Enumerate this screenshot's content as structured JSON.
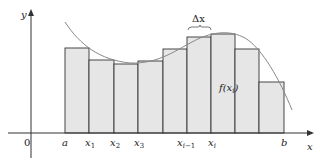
{
  "diagram": {
    "axes": {
      "x_label": "x",
      "y_label": "y",
      "origin_label": "0"
    },
    "tick_labels": [
      "a",
      "x1",
      "x2",
      "x3",
      "xi-1",
      "xi",
      "b"
    ],
    "annotations": {
      "delta": "Δx",
      "height": "f(xi)"
    },
    "rect_fill": "#e6e6e6",
    "stroke": "#333333",
    "curve_color": "#888888",
    "rects": [
      {
        "x": 65,
        "top": 48
      },
      {
        "x": 89,
        "top": 60
      },
      {
        "x": 114,
        "top": 64
      },
      {
        "x": 138,
        "top": 61
      },
      {
        "x": 163,
        "top": 49
      },
      {
        "x": 187,
        "top": 37
      },
      {
        "x": 211,
        "top": 34
      },
      {
        "x": 235,
        "top": 49
      },
      {
        "x": 259,
        "top": 82
      }
    ]
  }
}
